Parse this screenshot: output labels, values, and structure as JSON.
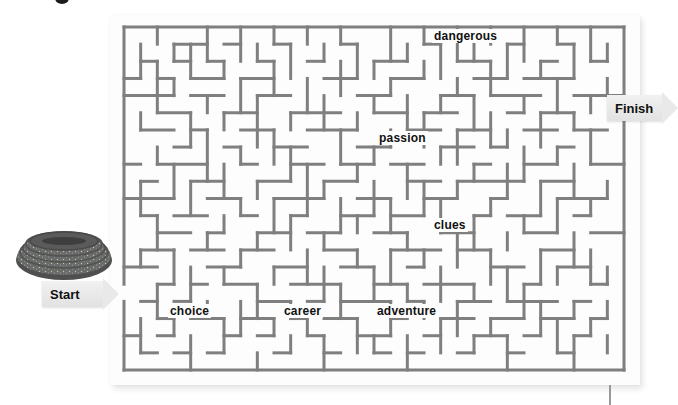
{
  "puzzle": {
    "type": "maze",
    "cols": 30,
    "rows": 20,
    "wall_color": "#7f7f7f",
    "origin": [
      124,
      27
    ],
    "cell_w": 16.6667,
    "cell_h": 17.15,
    "entrance": {
      "side": "left",
      "row": 15
    },
    "exit": {
      "side": "right",
      "row": 4
    }
  },
  "labels": {
    "start": "Start",
    "finish": "Finish"
  },
  "words": [
    {
      "text": "dangerous",
      "x": 432,
      "y": 29
    },
    {
      "text": "passion",
      "x": 377,
      "y": 131
    },
    {
      "text": "clues",
      "x": 432,
      "y": 218
    },
    {
      "text": "choice",
      "x": 168,
      "y": 304
    },
    {
      "text": "career",
      "x": 282,
      "y": 304
    },
    {
      "text": "adventure",
      "x": 375,
      "y": 304
    }
  ],
  "maze": {
    "h_walls": [
      [
        1,
        3,
        5
      ],
      [
        1,
        6,
        7
      ],
      [
        1,
        9,
        10
      ],
      [
        1,
        13,
        14
      ],
      [
        1,
        18,
        19
      ],
      [
        1,
        23,
        24
      ],
      [
        1,
        26,
        27
      ],
      [
        2,
        1,
        2
      ],
      [
        2,
        3,
        4
      ],
      [
        2,
        5,
        6
      ],
      [
        2,
        8,
        9
      ],
      [
        2,
        11,
        12
      ],
      [
        2,
        15,
        17
      ],
      [
        2,
        20,
        22
      ],
      [
        2,
        25,
        26
      ],
      [
        2,
        28,
        29
      ],
      [
        3,
        0,
        1
      ],
      [
        3,
        2,
        3
      ],
      [
        3,
        4,
        6
      ],
      [
        3,
        7,
        9
      ],
      [
        3,
        12,
        14
      ],
      [
        3,
        16,
        18
      ],
      [
        3,
        21,
        23
      ],
      [
        3,
        24,
        27
      ],
      [
        4,
        0,
        3
      ],
      [
        4,
        4,
        6
      ],
      [
        4,
        8,
        10
      ],
      [
        4,
        14,
        16
      ],
      [
        4,
        19,
        21
      ],
      [
        4,
        22,
        25
      ],
      [
        4,
        27,
        30
      ],
      [
        5,
        2,
        4
      ],
      [
        5,
        6,
        8
      ],
      [
        5,
        10,
        13
      ],
      [
        5,
        15,
        17
      ],
      [
        5,
        18,
        20
      ],
      [
        5,
        23,
        24
      ],
      [
        5,
        25,
        27
      ],
      [
        6,
        1,
        3
      ],
      [
        6,
        4,
        5
      ],
      [
        6,
        7,
        9
      ],
      [
        6,
        11,
        14
      ],
      [
        6,
        17,
        19
      ],
      [
        6,
        20,
        22
      ],
      [
        6,
        24,
        26
      ],
      [
        6,
        27,
        29
      ],
      [
        7,
        3,
        4
      ],
      [
        7,
        6,
        7
      ],
      [
        7,
        9,
        11
      ],
      [
        7,
        14,
        16
      ],
      [
        7,
        19,
        21
      ],
      [
        7,
        22,
        23
      ],
      [
        7,
        26,
        27
      ],
      [
        8,
        0,
        1
      ],
      [
        8,
        2,
        5
      ],
      [
        8,
        7,
        8
      ],
      [
        8,
        10,
        12
      ],
      [
        8,
        13,
        15
      ],
      [
        8,
        16,
        18
      ],
      [
        8,
        21,
        22
      ],
      [
        8,
        24,
        26
      ],
      [
        8,
        28,
        30
      ],
      [
        9,
        1,
        2
      ],
      [
        9,
        4,
        6
      ],
      [
        9,
        8,
        10
      ],
      [
        9,
        12,
        14
      ],
      [
        9,
        17,
        19
      ],
      [
        9,
        20,
        24
      ],
      [
        9,
        25,
        27
      ],
      [
        10,
        0,
        3
      ],
      [
        10,
        5,
        7
      ],
      [
        10,
        9,
        12
      ],
      [
        10,
        14,
        16
      ],
      [
        10,
        18,
        20
      ],
      [
        10,
        22,
        23
      ],
      [
        10,
        26,
        29
      ],
      [
        11,
        1,
        2
      ],
      [
        11,
        3,
        5
      ],
      [
        11,
        7,
        8
      ],
      [
        11,
        10,
        11
      ],
      [
        11,
        13,
        15
      ],
      [
        11,
        16,
        18
      ],
      [
        11,
        21,
        22
      ],
      [
        11,
        23,
        25
      ],
      [
        11,
        27,
        28
      ],
      [
        12,
        2,
        4
      ],
      [
        12,
        5,
        6
      ],
      [
        12,
        8,
        10
      ],
      [
        12,
        11,
        13
      ],
      [
        12,
        15,
        17
      ],
      [
        12,
        19,
        21
      ],
      [
        12,
        24,
        26
      ],
      [
        12,
        28,
        30
      ],
      [
        13,
        1,
        3
      ],
      [
        13,
        4,
        6
      ],
      [
        13,
        7,
        9
      ],
      [
        13,
        12,
        14
      ],
      [
        13,
        16,
        19
      ],
      [
        13,
        20,
        22
      ],
      [
        13,
        25,
        27
      ],
      [
        14,
        0,
        2
      ],
      [
        14,
        5,
        7
      ],
      [
        14,
        9,
        11
      ],
      [
        14,
        13,
        15
      ],
      [
        14,
        17,
        18
      ],
      [
        14,
        22,
        24
      ],
      [
        14,
        26,
        28
      ],
      [
        15,
        2,
        3
      ],
      [
        15,
        4,
        5
      ],
      [
        15,
        6,
        8
      ],
      [
        15,
        10,
        13
      ],
      [
        15,
        15,
        17
      ],
      [
        15,
        18,
        21
      ],
      [
        15,
        24,
        25
      ],
      [
        15,
        28,
        29
      ],
      [
        16,
        1,
        2
      ],
      [
        16,
        3,
        4
      ],
      [
        16,
        8,
        10
      ],
      [
        16,
        11,
        12
      ],
      [
        16,
        13,
        16
      ],
      [
        16,
        17,
        18
      ],
      [
        16,
        20,
        22
      ],
      [
        16,
        23,
        26
      ],
      [
        16,
        27,
        28
      ],
      [
        17,
        2,
        3
      ],
      [
        17,
        4,
        6
      ],
      [
        17,
        7,
        9
      ],
      [
        17,
        10,
        11
      ],
      [
        17,
        12,
        14
      ],
      [
        17,
        16,
        17
      ],
      [
        17,
        19,
        21
      ],
      [
        17,
        22,
        24
      ],
      [
        17,
        25,
        27
      ],
      [
        17,
        28,
        29
      ],
      [
        18,
        0,
        1
      ],
      [
        18,
        2,
        3
      ],
      [
        18,
        6,
        7
      ],
      [
        18,
        8,
        9
      ],
      [
        18,
        11,
        12
      ],
      [
        18,
        14,
        16
      ],
      [
        18,
        18,
        19
      ],
      [
        18,
        21,
        23
      ],
      [
        18,
        24,
        25
      ],
      [
        18,
        27,
        28
      ],
      [
        19,
        1,
        2
      ],
      [
        19,
        3,
        4
      ],
      [
        19,
        5,
        6
      ],
      [
        19,
        9,
        10
      ],
      [
        19,
        12,
        13
      ],
      [
        19,
        15,
        16
      ],
      [
        19,
        17,
        18
      ],
      [
        19,
        20,
        21
      ],
      [
        19,
        23,
        24
      ],
      [
        19,
        26,
        27
      ]
    ],
    "v_walls": [
      [
        1,
        1,
        3
      ],
      [
        1,
        5,
        6
      ],
      [
        1,
        9,
        11
      ],
      [
        1,
        13,
        14
      ],
      [
        1,
        17,
        19
      ],
      [
        2,
        0,
        1
      ],
      [
        2,
        2,
        5
      ],
      [
        2,
        7,
        8
      ],
      [
        2,
        11,
        13
      ],
      [
        2,
        15,
        17
      ],
      [
        3,
        1,
        2
      ],
      [
        3,
        3,
        4
      ],
      [
        3,
        8,
        10
      ],
      [
        3,
        13,
        15
      ],
      [
        3,
        17,
        18
      ],
      [
        4,
        1,
        3
      ],
      [
        4,
        5,
        7
      ],
      [
        4,
        9,
        11
      ],
      [
        4,
        14,
        16
      ],
      [
        4,
        18,
        20
      ],
      [
        5,
        0,
        2
      ],
      [
        5,
        4,
        5
      ],
      [
        5,
        6,
        9
      ],
      [
        5,
        12,
        13
      ],
      [
        5,
        16,
        17
      ],
      [
        6,
        2,
        3
      ],
      [
        6,
        5,
        6
      ],
      [
        6,
        8,
        10
      ],
      [
        6,
        11,
        12
      ],
      [
        6,
        14,
        15
      ],
      [
        6,
        17,
        19
      ],
      [
        7,
        0,
        2
      ],
      [
        7,
        3,
        5
      ],
      [
        7,
        7,
        8
      ],
      [
        7,
        10,
        11
      ],
      [
        7,
        13,
        14
      ],
      [
        7,
        16,
        18
      ],
      [
        8,
        1,
        2
      ],
      [
        8,
        4,
        7
      ],
      [
        8,
        9,
        10
      ],
      [
        8,
        12,
        13
      ],
      [
        8,
        15,
        17
      ],
      [
        8,
        19,
        20
      ],
      [
        9,
        0,
        1
      ],
      [
        9,
        2,
        4
      ],
      [
        9,
        6,
        8
      ],
      [
        9,
        10,
        12
      ],
      [
        9,
        14,
        15
      ],
      [
        9,
        17,
        18
      ],
      [
        10,
        1,
        3
      ],
      [
        10,
        5,
        6
      ],
      [
        10,
        7,
        9
      ],
      [
        10,
        11,
        13
      ],
      [
        10,
        16,
        17
      ],
      [
        10,
        18,
        19
      ],
      [
        11,
        0,
        1
      ],
      [
        11,
        3,
        5
      ],
      [
        11,
        8,
        11
      ],
      [
        11,
        13,
        15
      ],
      [
        11,
        17,
        18
      ],
      [
        12,
        1,
        2
      ],
      [
        12,
        4,
        6
      ],
      [
        12,
        9,
        10
      ],
      [
        12,
        12,
        13
      ],
      [
        12,
        14,
        16
      ],
      [
        12,
        18,
        20
      ],
      [
        13,
        0,
        1
      ],
      [
        13,
        2,
        4
      ],
      [
        13,
        6,
        8
      ],
      [
        13,
        10,
        12
      ],
      [
        13,
        15,
        17
      ],
      [
        14,
        1,
        3
      ],
      [
        14,
        5,
        6
      ],
      [
        14,
        8,
        9
      ],
      [
        14,
        11,
        12
      ],
      [
        14,
        13,
        14
      ],
      [
        14,
        17,
        19
      ],
      [
        15,
        2,
        3
      ],
      [
        15,
        4,
        5
      ],
      [
        15,
        7,
        8
      ],
      [
        15,
        9,
        11
      ],
      [
        15,
        14,
        16
      ],
      [
        15,
        18,
        19
      ],
      [
        16,
        0,
        2
      ],
      [
        16,
        3,
        4
      ],
      [
        16,
        6,
        7
      ],
      [
        16,
        10,
        12
      ],
      [
        16,
        13,
        15
      ],
      [
        16,
        16,
        18
      ],
      [
        17,
        1,
        2
      ],
      [
        17,
        4,
        6
      ],
      [
        17,
        8,
        10
      ],
      [
        17,
        12,
        13
      ],
      [
        17,
        15,
        16
      ],
      [
        17,
        18,
        20
      ],
      [
        18,
        0,
        1
      ],
      [
        18,
        2,
        3
      ],
      [
        18,
        5,
        7
      ],
      [
        18,
        9,
        11
      ],
      [
        18,
        13,
        14
      ],
      [
        18,
        16,
        17
      ],
      [
        19,
        1,
        3
      ],
      [
        19,
        4,
        5
      ],
      [
        19,
        7,
        8
      ],
      [
        19,
        10,
        12
      ],
      [
        19,
        14,
        16
      ],
      [
        19,
        17,
        19
      ],
      [
        20,
        0,
        2
      ],
      [
        20,
        3,
        4
      ],
      [
        20,
        6,
        8
      ],
      [
        20,
        9,
        10
      ],
      [
        20,
        12,
        14
      ],
      [
        20,
        16,
        18
      ],
      [
        21,
        1,
        2
      ],
      [
        21,
        4,
        6
      ],
      [
        21,
        8,
        9
      ],
      [
        21,
        11,
        13
      ],
      [
        21,
        15,
        16
      ],
      [
        21,
        18,
        19
      ],
      [
        22,
        0,
        1
      ],
      [
        22,
        2,
        4
      ],
      [
        22,
        5,
        7
      ],
      [
        22,
        10,
        11
      ],
      [
        22,
        13,
        15
      ],
      [
        22,
        17,
        18
      ],
      [
        23,
        1,
        3
      ],
      [
        23,
        6,
        7
      ],
      [
        23,
        8,
        10
      ],
      [
        23,
        12,
        13
      ],
      [
        23,
        14,
        16
      ],
      [
        23,
        18,
        20
      ],
      [
        24,
        0,
        2
      ],
      [
        24,
        4,
        5
      ],
      [
        24,
        7,
        9
      ],
      [
        24,
        11,
        12
      ],
      [
        24,
        15,
        17
      ],
      [
        25,
        2,
        3
      ],
      [
        25,
        5,
        7
      ],
      [
        25,
        9,
        11
      ],
      [
        25,
        13,
        15
      ],
      [
        25,
        16,
        18
      ],
      [
        26,
        0,
        1
      ],
      [
        26,
        3,
        5
      ],
      [
        26,
        7,
        8
      ],
      [
        26,
        10,
        12
      ],
      [
        26,
        14,
        15
      ],
      [
        26,
        17,
        19
      ],
      [
        27,
        1,
        3
      ],
      [
        27,
        5,
        6
      ],
      [
        27,
        8,
        10
      ],
      [
        27,
        12,
        14
      ],
      [
        27,
        16,
        17
      ],
      [
        27,
        18,
        20
      ],
      [
        28,
        0,
        2
      ],
      [
        28,
        4,
        5
      ],
      [
        28,
        6,
        8
      ],
      [
        28,
        10,
        11
      ],
      [
        28,
        13,
        15
      ],
      [
        28,
        17,
        18
      ],
      [
        29,
        1,
        2
      ],
      [
        29,
        3,
        4
      ],
      [
        29,
        9,
        10
      ],
      [
        29,
        14,
        15
      ],
      [
        29,
        16,
        17
      ],
      [
        29,
        18,
        19
      ]
    ]
  }
}
